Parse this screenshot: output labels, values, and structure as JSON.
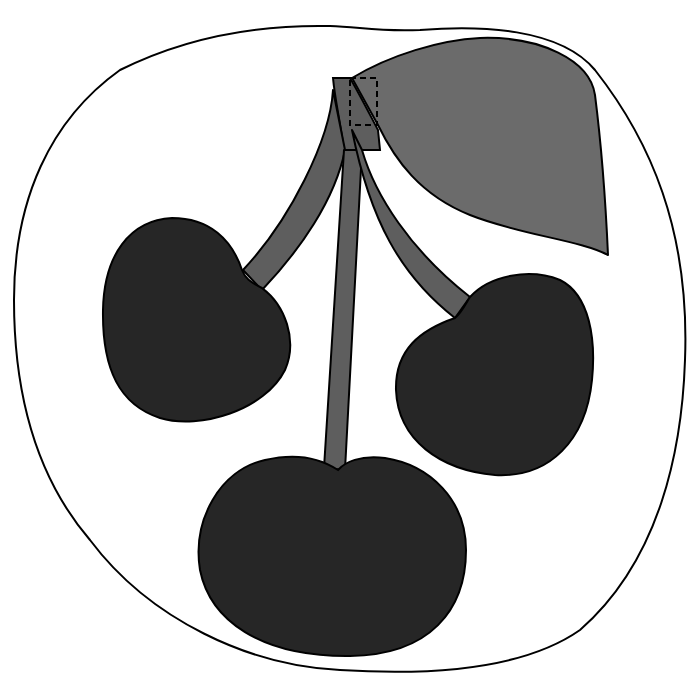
{
  "illustration": {
    "subject": "cherries",
    "cherry_count": 3,
    "colors": {
      "background": "#ffffff",
      "outline": "#000000",
      "cherry_fill": "#262626",
      "stem_fill": "#5e5e5e",
      "leaf_fill": "#6b6b6b"
    }
  }
}
